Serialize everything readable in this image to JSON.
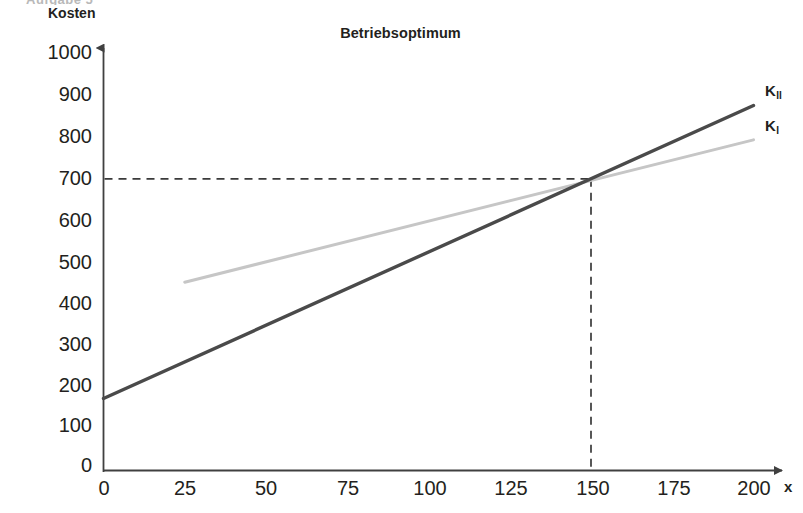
{
  "page": {
    "scan_artifact_text": "Aufgabe 5"
  },
  "chart_data": {
    "type": "line",
    "title": "Betriebsoptimum",
    "xlabel": "x",
    "ylabel": "Kosten",
    "xlim": [
      0,
      200
    ],
    "ylim": [
      0,
      1000
    ],
    "x_ticks": [
      0,
      25,
      50,
      75,
      100,
      125,
      150,
      175,
      200
    ],
    "y_ticks": [
      0,
      100,
      200,
      300,
      400,
      500,
      600,
      700,
      800,
      900,
      1000
    ],
    "grid": false,
    "legend": "inline-right",
    "series": [
      {
        "name": "K_I",
        "label": "K",
        "sublabel": "I",
        "color": "#c6c6c6",
        "x": [
          25,
          200
        ],
        "y": [
          450,
          790
        ],
        "intercept": 400,
        "slope": 1.943
      },
      {
        "name": "K_II",
        "label": "K",
        "sublabel": "II",
        "color": "#4a4a4a",
        "x": [
          0,
          200
        ],
        "y": [
          172,
          872
        ],
        "intercept": 172,
        "slope": 3.5
      }
    ],
    "annotations": [
      {
        "name": "intersection",
        "x": 150,
        "y": 697,
        "guide_horizontal": true,
        "guide_vertical": true,
        "style": "dashed"
      }
    ]
  },
  "y_axis_labels": [
    "1000",
    "900",
    "800",
    "700",
    "600",
    "500",
    "400",
    "300",
    "200",
    "100",
    "0"
  ],
  "x_axis_labels": [
    "0",
    "25",
    "50",
    "75",
    "100",
    "125",
    "150",
    "175",
    "200"
  ]
}
